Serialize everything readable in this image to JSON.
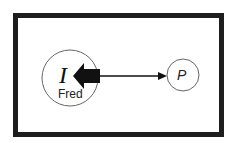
{
  "diagram": {
    "nodes": [
      {
        "id": "I",
        "label": "I",
        "sublabel": "Fred",
        "shape": "circle"
      },
      {
        "id": "P",
        "label": "P",
        "shape": "circle"
      }
    ],
    "edges": [
      {
        "from": "center",
        "to": "I",
        "style": "thick-block-arrow"
      },
      {
        "from": "center",
        "to": "P",
        "style": "thin-arrow"
      }
    ],
    "colors": {
      "frame": "#1e1e1e",
      "stroke": "#555555",
      "arrow": "#111111",
      "background": "#ffffff"
    }
  }
}
